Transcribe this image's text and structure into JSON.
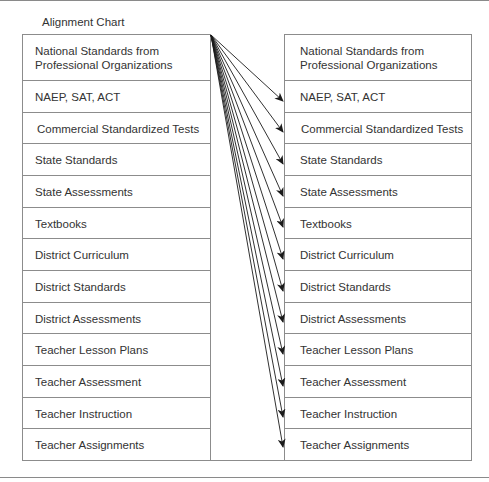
{
  "title": "Alignment Chart",
  "left_column": {
    "rows": [
      {
        "label": "National Standards from Professional Organizations"
      },
      {
        "label": "NAEP, SAT, ACT"
      },
      {
        "label": "Commercial Standardized Tests"
      },
      {
        "label": "State Standards"
      },
      {
        "label": "State Assessments"
      },
      {
        "label": "Textbooks"
      },
      {
        "label": "District Curriculum"
      },
      {
        "label": "District Standards"
      },
      {
        "label": "District Assessments"
      },
      {
        "label": "Teacher Lesson Plans"
      },
      {
        "label": "Teacher Assessment"
      },
      {
        "label": "Teacher Instruction"
      },
      {
        "label": "Teacher Assignments"
      }
    ]
  },
  "right_column": {
    "rows": [
      {
        "label": "National Standards from Professional Organizations"
      },
      {
        "label": "NAEP, SAT, ACT"
      },
      {
        "label": "Commercial Standardized Tests"
      },
      {
        "label": "State Standards"
      },
      {
        "label": "State Assessments"
      },
      {
        "label": "Textbooks"
      },
      {
        "label": "District Curriculum"
      },
      {
        "label": "District Standards"
      },
      {
        "label": "District Assessments"
      },
      {
        "label": "Teacher Lesson Plans"
      },
      {
        "label": "Teacher Assessment"
      },
      {
        "label": "Teacher Instruction"
      },
      {
        "label": "Teacher Assignments"
      }
    ]
  },
  "arrows": {
    "source": "National Standards from Professional Organizations",
    "targets": [
      "NAEP, SAT, ACT",
      "Commercial Standardized Tests",
      "State Standards",
      "State Assessments",
      "Textbooks",
      "District Curriculum",
      "District Standards",
      "District Assessments",
      "Teacher Lesson Plans",
      "Teacher Assessment",
      "Teacher Instruction",
      "Teacher Assignments"
    ],
    "color": "#1a1a1a"
  }
}
